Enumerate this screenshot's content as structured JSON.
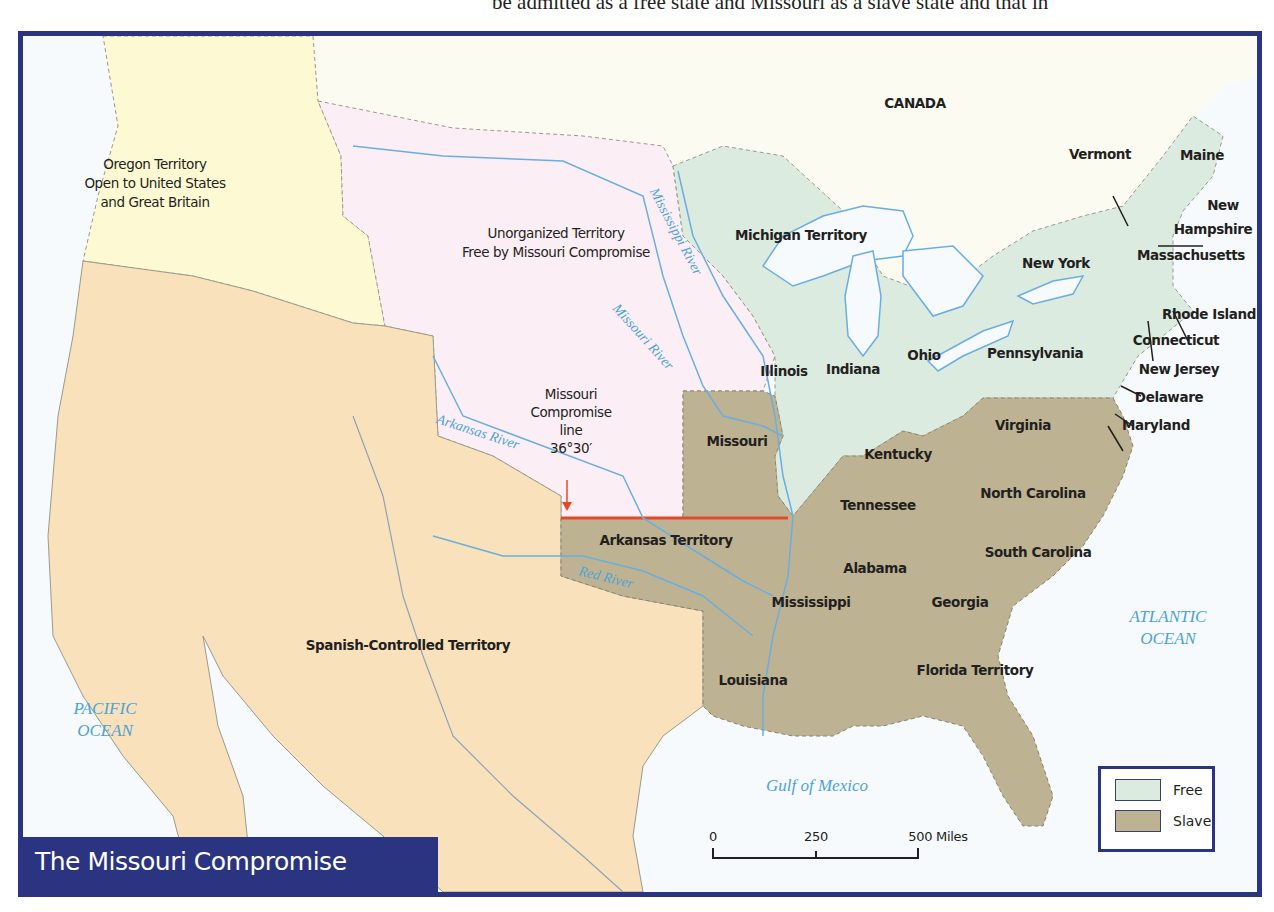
{
  "top_text": "be admitted as a free state and Missouri as a slave state and that in",
  "title": "The Missouri Compromise",
  "colors": {
    "border": "#2a3480",
    "water": "#f6fafd",
    "water_label": "#4ea3d6",
    "river": "#6aaee0",
    "canada": "#fcfbf2",
    "oregon": "#fdf9d3",
    "unorganized": "#fbeff5",
    "spanish": "#f9e1bb",
    "free": "#dcebe0",
    "slave": "#bdb392",
    "compromise_line": "#e8482a"
  },
  "regions": [
    {
      "name": "Oregon Territory",
      "subtitle": [
        "Open to United States",
        "and Great Britain"
      ],
      "x": 150,
      "y": 175
    },
    {
      "name": "Unorganized Territory",
      "subtitle": [
        "Free by Missouri Compromise"
      ],
      "x": 551,
      "y": 235
    },
    {
      "name": "Spanish-Controlled Territory",
      "subtitle": [],
      "x": 403,
      "y": 640
    },
    {
      "name": "CANADA",
      "subtitle": [],
      "x": 910,
      "y": 98
    }
  ],
  "states": [
    {
      "name": "Michigan Territory",
      "type": "free",
      "x": 796,
      "y": 230
    },
    {
      "name": "Vermont",
      "type": "free",
      "x": 1095,
      "y": 149
    },
    {
      "name": "Maine",
      "type": "free",
      "x": 1197,
      "y": 150
    },
    {
      "name": "New",
      "type": "free",
      "x": 1218,
      "y": 200
    },
    {
      "name": "Hampshire",
      "type": "free",
      "x": 1208,
      "y": 224
    },
    {
      "name": "Massachusetts",
      "type": "free",
      "x": 1186,
      "y": 250
    },
    {
      "name": "New York",
      "type": "free",
      "x": 1051,
      "y": 258
    },
    {
      "name": "Rhode Island",
      "type": "free",
      "x": 1204,
      "y": 309
    },
    {
      "name": "Connecticut",
      "type": "free",
      "x": 1171,
      "y": 335
    },
    {
      "name": "Pennsylvania",
      "type": "free",
      "x": 1030,
      "y": 348
    },
    {
      "name": "New Jersey",
      "type": "free",
      "x": 1174,
      "y": 364
    },
    {
      "name": "Illinois",
      "type": "free",
      "x": 779,
      "y": 366
    },
    {
      "name": "Indiana",
      "type": "free",
      "x": 848,
      "y": 364
    },
    {
      "name": "Ohio",
      "type": "free",
      "x": 919,
      "y": 350
    },
    {
      "name": "Delaware",
      "type": "slave",
      "x": 1164,
      "y": 392
    },
    {
      "name": "Maryland",
      "type": "slave",
      "x": 1151,
      "y": 420
    },
    {
      "name": "Virginia",
      "type": "slave",
      "x": 1018,
      "y": 420
    },
    {
      "name": "Missouri",
      "type": "slave",
      "x": 732,
      "y": 436
    },
    {
      "name": "Kentucky",
      "type": "slave",
      "x": 893,
      "y": 449
    },
    {
      "name": "Tennessee",
      "type": "slave",
      "x": 873,
      "y": 500
    },
    {
      "name": "North Carolina",
      "type": "slave",
      "x": 1028,
      "y": 488
    },
    {
      "name": "Arkansas Territory",
      "type": "slave",
      "x": 661,
      "y": 535
    },
    {
      "name": "South Carolina",
      "type": "slave",
      "x": 1033,
      "y": 547
    },
    {
      "name": "Alabama",
      "type": "slave",
      "x": 870,
      "y": 563
    },
    {
      "name": "Mississippi",
      "type": "slave",
      "x": 806,
      "y": 597
    },
    {
      "name": "Georgia",
      "type": "slave",
      "x": 955,
      "y": 597
    },
    {
      "name": "Louisiana",
      "type": "slave",
      "x": 748,
      "y": 675
    },
    {
      "name": "Florida Territory",
      "type": "slave",
      "x": 970,
      "y": 665
    }
  ],
  "compromise_label": {
    "lines": [
      "Missouri",
      "Compromise",
      "line",
      "36°30′"
    ],
    "x": 596,
    "y": 420
  },
  "water_bodies": [
    {
      "name": "PACIFIC",
      "name2": "OCEAN",
      "x": 100,
      "y": 715
    },
    {
      "name": "ATLANTIC",
      "name2": "OCEAN",
      "x": 1163,
      "y": 623
    },
    {
      "name": "Gulf of Mexico",
      "name2": "",
      "x": 812,
      "y": 750
    }
  ],
  "rivers": [
    {
      "name": "Mississippi River",
      "x": 645,
      "y": 155,
      "angle": 62
    },
    {
      "name": "Missouri River",
      "x": 592,
      "y": 270,
      "angle": 48
    },
    {
      "name": "Arkansas River",
      "x": 414,
      "y": 383,
      "angle": 18
    },
    {
      "name": "Red River",
      "x": 556,
      "y": 534,
      "angle": 14
    }
  ],
  "legend": {
    "items": [
      {
        "label": "Free",
        "color": "#dcebe0"
      },
      {
        "label": "Slave",
        "color": "#bdb392"
      }
    ]
  },
  "scale_bar": {
    "ticks": [
      "0",
      "250",
      "500 Miles"
    ],
    "unit": "Miles"
  }
}
